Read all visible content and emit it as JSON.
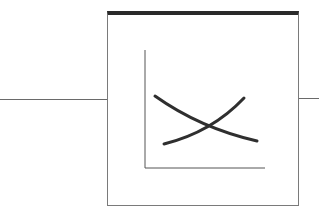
{
  "diagram": {
    "type": "block-with-io",
    "block": {
      "label": "",
      "border_color": "#7a7a7a",
      "header_color": "#2a2a2a",
      "icon": "crossing-curves-graph-icon"
    },
    "input_wire": {
      "color": "#6a6a6a"
    },
    "output_wire": {
      "color": "#6a6a6a"
    },
    "inner_plot": {
      "axes": "L-shaped",
      "curves": [
        {
          "name": "decreasing",
          "points": [
            [
              155,
              96
            ],
            [
              180,
              112
            ],
            [
              208,
              127
            ],
            [
              235,
              136
            ],
            [
              257,
              141
            ]
          ]
        },
        {
          "name": "increasing",
          "points": [
            [
              164,
              144
            ],
            [
              188,
              139
            ],
            [
              208,
              127
            ],
            [
              228,
              113
            ],
            [
              244,
              98
            ]
          ]
        }
      ]
    }
  }
}
